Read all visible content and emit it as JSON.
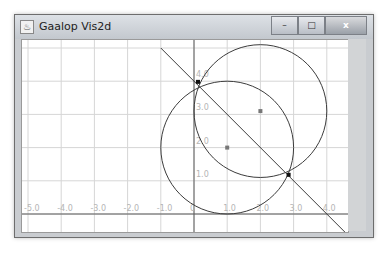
{
  "window": {
    "title": "Gaalop Vis2d",
    "icon": "java-app-icon",
    "controls": {
      "minimize": "–",
      "maximize": "□",
      "close": "x"
    }
  },
  "plot": {
    "x_range": [
      -5.5,
      4.5
    ],
    "y_range": [
      -0.9,
      5.2
    ],
    "x_ticks": [
      -5,
      -4,
      -3,
      -2,
      -1,
      0,
      1,
      2,
      3,
      4
    ],
    "x_tick_labels": [
      "-5.0",
      "-4.0",
      "-3.0",
      "-2.0",
      "-1.0",
      "0",
      "1.0",
      "2.0",
      "3.0",
      "4.0"
    ],
    "y_ticks": [
      1,
      2,
      3,
      4
    ],
    "y_tick_labels": [
      "1.0",
      "2.0",
      "3.0",
      "4.0"
    ],
    "colors": {
      "grid": "#d6d6d6",
      "axis": "#5a5a5a",
      "geometry": "#3c3c3c",
      "label": "#b5b5b5",
      "center_point": "#777777",
      "intersection": "#111111"
    },
    "objects": {
      "circles": [
        {
          "name": "circle-a",
          "cx": 2.0,
          "cy": 3.1,
          "r": 2.0
        },
        {
          "name": "circle-b",
          "cx": 1.0,
          "cy": 2.0,
          "r": 2.0
        }
      ],
      "line": {
        "name": "line-l",
        "p1": [
          -1.0,
          5.0
        ],
        "p2": [
          4.9,
          -0.9
        ]
      },
      "points": [
        {
          "name": "center-a",
          "x": 2.0,
          "y": 3.1,
          "kind": "center"
        },
        {
          "name": "center-b",
          "x": 1.0,
          "y": 2.0,
          "kind": "center"
        },
        {
          "name": "intersection-1",
          "x": 0.12,
          "y": 3.98,
          "kind": "intersection"
        },
        {
          "name": "intersection-2",
          "x": 2.85,
          "y": 1.18,
          "kind": "intersection"
        }
      ]
    }
  }
}
